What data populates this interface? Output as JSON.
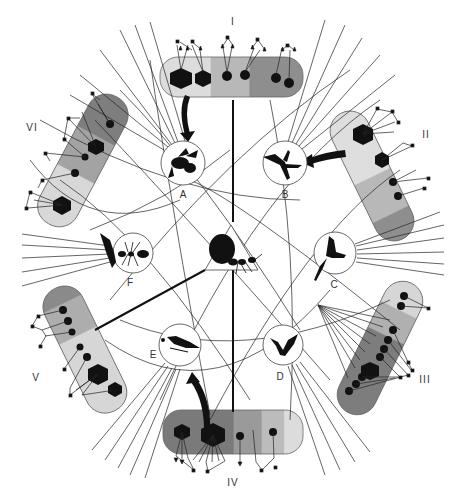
{
  "figure": {
    "type": "circular pollination / interaction network diagram",
    "center_node": {
      "id": "center",
      "icon": "ant-with-resource-icon",
      "shape": "triangle"
    },
    "species_nodes": [
      {
        "id": "A",
        "label": "A",
        "icon": "bee-icon",
        "cx": 183,
        "cy": 163
      },
      {
        "id": "B",
        "label": "B",
        "icon": "hummingbird-icon",
        "cx": 285,
        "cy": 163
      },
      {
        "id": "C",
        "label": "C",
        "icon": "hummingbird-perched-icon",
        "cx": 335,
        "cy": 253
      },
      {
        "id": "D",
        "label": "D",
        "icon": "bat-icon",
        "cx": 285,
        "cy": 345
      },
      {
        "id": "E",
        "label": "E",
        "icon": "bird-icon",
        "cx": 180,
        "cy": 348
      },
      {
        "id": "F",
        "label": "F",
        "icon": "ant-icon",
        "cx": 132,
        "cy": 253
      }
    ],
    "plant_bands": [
      {
        "id": "I",
        "label": "I"
      },
      {
        "id": "II",
        "label": "II"
      },
      {
        "id": "III",
        "label": "III"
      },
      {
        "id": "IV",
        "label": "IV"
      },
      {
        "id": "V",
        "label": "V"
      },
      {
        "id": "VI",
        "label": "VI"
      }
    ],
    "colors": {
      "ink": "#1a1a1a",
      "band_light": "#e2e2e2",
      "band_mid": "#bdbdbd",
      "band_dark": "#8f8f8f",
      "band_darker": "#6e6e6e",
      "outline": "#555555"
    }
  }
}
